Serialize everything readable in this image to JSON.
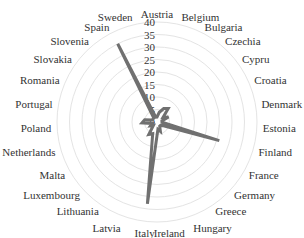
{
  "chart_data": {
    "type": "radar",
    "title": "",
    "categories": [
      "Austria",
      "Belgium",
      "Bulgaria",
      "Czechia",
      "Cypru",
      "Croatia",
      "Denmark",
      "Estonia",
      "Finland",
      "France",
      "Germany",
      "Greece",
      "Hungary",
      "Ireland",
      "Italy",
      "Latvia",
      "Lithuania",
      "Luxembourg",
      "Malta",
      "Netherlands",
      "Poland",
      "Portugal",
      "Romania",
      "Slovakia",
      "Slovenia",
      "Spain",
      "Sweden"
    ],
    "series": [
      {
        "name": "value",
        "values": [
          2,
          4,
          6,
          7,
          3,
          5,
          2,
          2,
          26,
          3,
          2,
          2,
          4,
          3,
          33,
          5,
          6,
          2,
          3,
          2,
          6,
          5,
          2,
          2,
          2,
          35,
          2
        ],
        "color": "#707070"
      }
    ],
    "radial_ticks": [
      "0",
      "5",
      "10",
      "15",
      "20",
      "25",
      "30",
      "35",
      "40"
    ],
    "rlim": [
      0,
      40
    ],
    "grid": true,
    "legend": "none"
  }
}
